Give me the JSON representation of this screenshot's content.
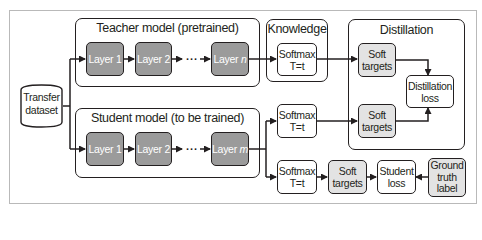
{
  "diagram": {
    "type": "knowledge-distillation-flow",
    "colors": {
      "stroke": "#231f20",
      "layer_fill": "#9b9b9b",
      "soft_target_fill": "#e3e3e3",
      "frame_border": "#b9b9b9"
    },
    "dataset": {
      "line1": "Transfer",
      "line2": "dataset"
    },
    "teacher": {
      "title": "Teacher model (pretrained)",
      "layers": [
        {
          "label": "Layer 1"
        },
        {
          "label": "Layer 2"
        },
        {
          "label": "Layer ",
          "var": "n"
        }
      ],
      "ellipsis": "..."
    },
    "student": {
      "title": "Student model (to be trained)",
      "layers": [
        {
          "label": "Layer 1"
        },
        {
          "label": "Layer 2"
        },
        {
          "label": "Layer ",
          "var": "m"
        }
      ],
      "ellipsis": "..."
    },
    "knowledge": {
      "title": "Knowledge",
      "softmax": {
        "line1": "Softmax",
        "line2": "T=t"
      }
    },
    "distillation": {
      "title": "Distillation",
      "soft_targets_top": {
        "line1": "Soft",
        "line2": "targets"
      },
      "soft_targets_bottom": {
        "line1": "Soft",
        "line2": "targets"
      },
      "loss": {
        "line1": "Distillation",
        "line2": "loss"
      }
    },
    "student_softmax_mid": {
      "line1": "Softmax",
      "line2": "T=t"
    },
    "student_softmax_low": {
      "line1": "Softmax",
      "line2": "T=t"
    },
    "student_soft_targets": {
      "line1": "Soft",
      "line2": "targets"
    },
    "student_loss": {
      "line1": "Student",
      "line2": "loss"
    },
    "ground_truth": {
      "line1": "Ground",
      "line2": "truth",
      "line3": "label"
    }
  }
}
